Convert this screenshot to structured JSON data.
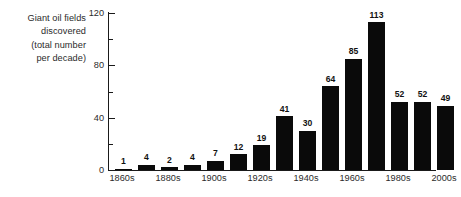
{
  "chart_data": {
    "type": "bar",
    "title": "Giant oil fields discovered (total number per decade)",
    "title_lines": [
      "Giant oil fields",
      "discovered",
      "(total number",
      "per decade)"
    ],
    "xlabel": "",
    "ylabel": "",
    "categories": [
      "1860s",
      "1870s",
      "1880s",
      "1890s",
      "1900s",
      "1910s",
      "1920s",
      "1930s",
      "1940s",
      "1950s",
      "1960s",
      "1970s",
      "1980s",
      "1990s",
      "2000s"
    ],
    "values": [
      1,
      4,
      2,
      4,
      7,
      12,
      19,
      41,
      30,
      64,
      85,
      113,
      52,
      52,
      49
    ],
    "value_labels": [
      "1",
      "4",
      "2",
      "4",
      "7",
      "12",
      "19",
      "41",
      "30",
      "64",
      "85",
      "113",
      "52",
      "52",
      "49"
    ],
    "visible_xtick_labels": [
      "1860s",
      "1880s",
      "1900s",
      "1920s",
      "1940s",
      "1960s",
      "1980s",
      "2000s"
    ],
    "visible_xtick_indices": [
      0,
      2,
      4,
      6,
      8,
      10,
      12,
      14
    ],
    "ylim": [
      0,
      120
    ],
    "ymajor_ticks": [
      0,
      40,
      80,
      120
    ],
    "ymajor_tick_labels": [
      "0",
      "40",
      "80",
      "120"
    ],
    "yminor_ticks": [
      20,
      60,
      100
    ],
    "grid": false,
    "legend": null,
    "bar_color": "#0a0a0a",
    "axis_color": "#1a1a1a",
    "background_color": "#ffffff"
  }
}
